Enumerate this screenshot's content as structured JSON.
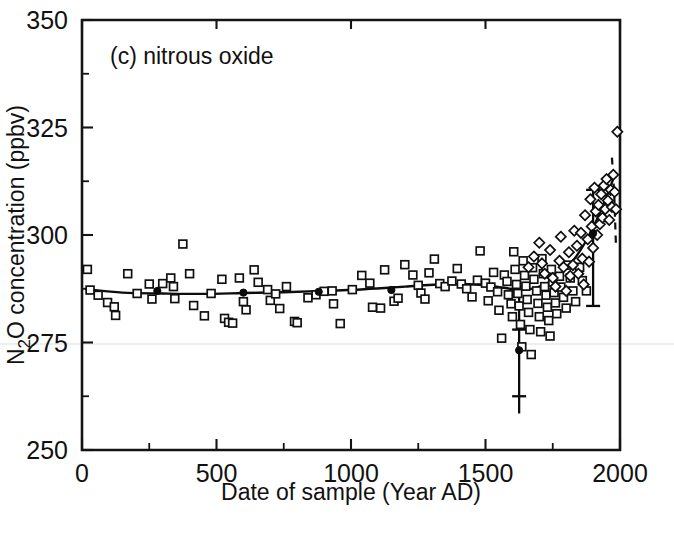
{
  "figure": {
    "panel_label": "(c) nitrous oxide",
    "background_color": "#ffffff",
    "ink_color": "#101010"
  },
  "chart_data": {
    "type": "scatter",
    "title": "(c) nitrous oxide",
    "xlabel": "Date of sample (Year AD)",
    "ylabel": "N₂O concentration (ppbv)",
    "ylabel_parts": {
      "pre": "N",
      "sub": "2",
      "post": "O concentration (ppbv)"
    },
    "xlim": [
      0,
      2000
    ],
    "ylim": [
      250,
      350
    ],
    "grid": false,
    "legend": null,
    "xticks": [
      0,
      500,
      1000,
      1500,
      2000
    ],
    "xticklabels": [
      "0",
      "500",
      "1000",
      "1500",
      "2000"
    ],
    "xminor_ticks": [
      250,
      750,
      1250,
      1750
    ],
    "yticks": [
      250,
      275,
      300,
      325,
      350
    ],
    "yticklabels": [
      "250",
      "275",
      "300",
      "325",
      "350"
    ],
    "yminor_ticks": [
      262.5,
      287.5,
      312.5,
      337.5
    ],
    "series": [
      {
        "name": "ice core samples (open squares)",
        "marker": "open-square",
        "points": [
          [
            20,
            292.0
          ],
          [
            30,
            287.2
          ],
          [
            60,
            286.0
          ],
          [
            95,
            284.3
          ],
          [
            120,
            283.3
          ],
          [
            125,
            281.3
          ],
          [
            170,
            291.0
          ],
          [
            205,
            286.4
          ],
          [
            250,
            288.6
          ],
          [
            260,
            285.1
          ],
          [
            300,
            288.7
          ],
          [
            330,
            290.0
          ],
          [
            340,
            288.0
          ],
          [
            345,
            285.2
          ],
          [
            375,
            297.9
          ],
          [
            400,
            291.0
          ],
          [
            415,
            283.6
          ],
          [
            455,
            281.2
          ],
          [
            480,
            286.4
          ],
          [
            520,
            289.7
          ],
          [
            530,
            280.6
          ],
          [
            545,
            279.7
          ],
          [
            560,
            279.5
          ],
          [
            585,
            290.0
          ],
          [
            600,
            284.5
          ],
          [
            610,
            282.6
          ],
          [
            640,
            291.9
          ],
          [
            655,
            289.0
          ],
          [
            690,
            287.3
          ],
          [
            700,
            284.8
          ],
          [
            720,
            286.3
          ],
          [
            735,
            282.9
          ],
          [
            760,
            288.0
          ],
          [
            790,
            279.9
          ],
          [
            800,
            279.6
          ],
          [
            840,
            285.4
          ],
          [
            870,
            286.1
          ],
          [
            900,
            286.9
          ],
          [
            930,
            287.0
          ],
          [
            935,
            284.0
          ],
          [
            960,
            279.4
          ],
          [
            1005,
            287.3
          ],
          [
            1040,
            290.6
          ],
          [
            1070,
            288.8
          ],
          [
            1080,
            283.2
          ],
          [
            1110,
            283.0
          ],
          [
            1125,
            291.9
          ],
          [
            1160,
            284.6
          ],
          [
            1175,
            285.3
          ],
          [
            1200,
            293.1
          ],
          [
            1230,
            290.7
          ],
          [
            1250,
            288.3
          ],
          [
            1260,
            286.5
          ],
          [
            1275,
            285.1
          ],
          [
            1290,
            291.2
          ],
          [
            1310,
            294.4
          ],
          [
            1330,
            288.7
          ],
          [
            1350,
            288.0
          ],
          [
            1375,
            289.3
          ],
          [
            1395,
            292.2
          ],
          [
            1410,
            288.6
          ],
          [
            1430,
            287.5
          ],
          [
            1450,
            285.6
          ],
          [
            1470,
            289.5
          ],
          [
            1480,
            296.3
          ],
          [
            1500,
            288.8
          ],
          [
            1510,
            284.7
          ],
          [
            1520,
            287.9
          ],
          [
            1530,
            291.3
          ],
          [
            1545,
            286.8
          ],
          [
            1550,
            282.5
          ],
          [
            1560,
            276.0
          ],
          [
            1570,
            290.7
          ],
          [
            1580,
            289.2
          ],
          [
            1585,
            286.1
          ],
          [
            1595,
            284.0
          ],
          [
            1600,
            281.0
          ],
          [
            1605,
            296.1
          ],
          [
            1610,
            292.0
          ],
          [
            1615,
            288.5
          ],
          [
            1620,
            286.4
          ],
          [
            1625,
            283.5
          ],
          [
            1630,
            279.2
          ],
          [
            1635,
            274.0
          ],
          [
            1640,
            294.0
          ],
          [
            1645,
            290.6
          ],
          [
            1650,
            288.1
          ],
          [
            1655,
            285.0
          ],
          [
            1660,
            282.0
          ],
          [
            1665,
            278.0
          ],
          [
            1670,
            272.2
          ],
          [
            1675,
            292.4
          ],
          [
            1680,
            289.7
          ],
          [
            1690,
            287.0
          ],
          [
            1695,
            284.1
          ],
          [
            1700,
            281.0
          ],
          [
            1705,
            277.5
          ],
          [
            1710,
            294.5
          ],
          [
            1715,
            291.0
          ],
          [
            1720,
            288.0
          ],
          [
            1725,
            286.0
          ],
          [
            1730,
            283.2
          ],
          [
            1735,
            280.1
          ],
          [
            1740,
            276.5
          ],
          [
            1745,
            292.0
          ],
          [
            1750,
            289.0
          ],
          [
            1755,
            286.6
          ],
          [
            1760,
            284.2
          ],
          [
            1765,
            281.7
          ],
          [
            1775,
            290.4
          ],
          [
            1780,
            287.9
          ],
          [
            1790,
            285.5
          ],
          [
            1800,
            283.0
          ],
          [
            1805,
            293.0
          ],
          [
            1815,
            290.0
          ],
          [
            1825,
            287.0
          ],
          [
            1835,
            284.5
          ],
          [
            1850,
            292.5
          ],
          [
            1860,
            289.4
          ],
          [
            1875,
            287.0
          ]
        ]
      },
      {
        "name": "recent / firn samples (open diamonds)",
        "marker": "open-diamond",
        "points": [
          [
            1660,
            292.5
          ],
          [
            1680,
            295.0
          ],
          [
            1700,
            298.2
          ],
          [
            1710,
            293.4
          ],
          [
            1720,
            291.0
          ],
          [
            1740,
            296.5
          ],
          [
            1750,
            290.0
          ],
          [
            1760,
            288.0
          ],
          [
            1775,
            294.0
          ],
          [
            1780,
            299.6
          ],
          [
            1790,
            292.5
          ],
          [
            1800,
            287.0
          ],
          [
            1810,
            296.0
          ],
          [
            1815,
            290.5
          ],
          [
            1825,
            293.0
          ],
          [
            1830,
            301.0
          ],
          [
            1840,
            297.5
          ],
          [
            1845,
            291.0
          ],
          [
            1855,
            300.5
          ],
          [
            1860,
            294.5
          ],
          [
            1865,
            288.5
          ],
          [
            1870,
            304.6
          ],
          [
            1880,
            299.0
          ],
          [
            1885,
            293.8
          ],
          [
            1890,
            308.3
          ],
          [
            1895,
            302.0
          ],
          [
            1900,
            297.0
          ],
          [
            1905,
            311.0
          ],
          [
            1910,
            305.5
          ],
          [
            1915,
            300.0
          ],
          [
            1920,
            307.0
          ],
          [
            1925,
            302.5
          ],
          [
            1930,
            309.5
          ],
          [
            1935,
            304.0
          ],
          [
            1940,
            311.5
          ],
          [
            1945,
            306.0
          ],
          [
            1950,
            313.0
          ],
          [
            1955,
            308.0
          ],
          [
            1960,
            303.5
          ],
          [
            1965,
            310.5
          ],
          [
            1970,
            306.5
          ],
          [
            1975,
            314.0
          ],
          [
            1980,
            310.0
          ],
          [
            1985,
            306.0
          ],
          [
            1990,
            324.0
          ]
        ]
      },
      {
        "name": "binned means on fitted curve (filled circles)",
        "marker": "filled-circle",
        "points": [
          [
            280,
            287.0
          ],
          [
            600,
            286.6
          ],
          [
            880,
            286.8
          ],
          [
            1150,
            287.2
          ],
          [
            1625,
            273.2
          ],
          [
            1900,
            300.4
          ]
        ]
      }
    ],
    "fit_curve": {
      "name": "fitted trend",
      "style": "solid",
      "points": [
        [
          15,
          287.4
        ],
        [
          150,
          286.6
        ],
        [
          300,
          286.4
        ],
        [
          450,
          286.3
        ],
        [
          600,
          286.5
        ],
        [
          750,
          286.7
        ],
        [
          900,
          287.0
        ],
        [
          1050,
          287.4
        ],
        [
          1200,
          288.0
        ],
        [
          1320,
          288.5
        ],
        [
          1420,
          288.6
        ],
        [
          1500,
          288.3
        ],
        [
          1560,
          287.8
        ],
        [
          1620,
          287.3
        ],
        [
          1680,
          287.6
        ],
        [
          1730,
          288.8
        ],
        [
          1780,
          291.0
        ],
        [
          1830,
          294.4
        ],
        [
          1870,
          298.2
        ],
        [
          1905,
          302.4
        ],
        [
          1935,
          306.6
        ],
        [
          1960,
          310.5
        ],
        [
          1980,
          314.0
        ]
      ]
    },
    "dashed_segment": {
      "name": "extrapolated upper trend",
      "style": "dashed",
      "points": [
        [
          1970,
          318.0
        ],
        [
          1978,
          310.0
        ],
        [
          1982,
          303.0
        ],
        [
          1985,
          297.5
        ]
      ]
    },
    "error_bars": [
      {
        "name": "error-bar-1625",
        "x": 1625,
        "y": 273.2,
        "y_low": 258.5,
        "y_high": 288.0,
        "caps": [
          262.5,
          278.0,
          288.0
        ]
      },
      {
        "name": "error-bar-1900",
        "x": 1900,
        "y": 300.4,
        "y_low": 283.5,
        "y_high": 310.5,
        "caps": [
          283.5,
          310.5
        ]
      }
    ],
    "annotations": []
  }
}
